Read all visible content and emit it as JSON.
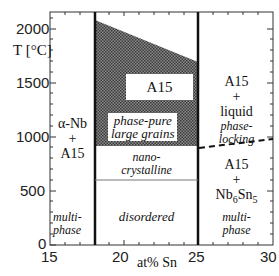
{
  "diagram": {
    "title": "",
    "y_axis": {
      "label": "T [°C]",
      "ticks": [
        "0",
        "500",
        "1000",
        "1500",
        "2000"
      ]
    },
    "x_axis": {
      "label": "at% Sn",
      "ticks": [
        "15",
        "20",
        "25",
        "30"
      ]
    },
    "regions": {
      "left": {
        "main": [
          "α-Nb",
          "+",
          "A15"
        ],
        "sub": [
          "multi-",
          "phase"
        ]
      },
      "center": {
        "a15_box": "A15",
        "phase_pure": [
          "phase-pure",
          "large grains"
        ],
        "nano": [
          "nano-",
          "crystalline"
        ],
        "disordered": "disordered"
      },
      "right_upper": {
        "main": [
          "A15",
          "+",
          "liquid"
        ],
        "sub": [
          "phase-",
          "locking"
        ]
      },
      "right_lower": {
        "main_line1": "A15",
        "main_line2": "+",
        "nb": "Nb",
        "sub6": "6",
        "sn": "Sn",
        "sub5": "5",
        "sub": [
          "multi-",
          "phase"
        ]
      }
    },
    "colors": {
      "shade": "#6b6b6b",
      "lines": "#111111"
    }
  }
}
